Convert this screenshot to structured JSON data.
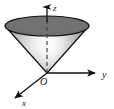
{
  "figure": {
    "background_color": "#ffffff",
    "outline_color": "#111111"
  },
  "axes": {
    "z": {
      "label": "z",
      "label_x": 53,
      "label_y": 10,
      "line": {
        "x1": 47,
        "y1": 73,
        "x2": 47,
        "y2": 5
      },
      "arrow_tip": {
        "x": 47,
        "y": 3
      },
      "visible_segment": {
        "x1": 47,
        "y1": 16,
        "x2": 47,
        "y2": 5
      },
      "hidden_segment_dashed": {
        "x1": 47,
        "y1": 73,
        "x2": 47,
        "y2": 17
      },
      "color": "#111111"
    },
    "y": {
      "label": "y",
      "label_x": 103,
      "label_y": 78,
      "line": {
        "x1": 47,
        "y1": 73,
        "x2": 97,
        "y2": 73
      },
      "arrow_tip": {
        "x": 99,
        "y": 73
      },
      "color": "#111111"
    },
    "x": {
      "label": "x",
      "label_x": 24,
      "label_y": 105,
      "line": {
        "x1": 47,
        "y1": 73,
        "x2": 14,
        "y2": 99
      },
      "arrow_tip": {
        "x": 11,
        "y": 101
      },
      "color": "#111111"
    },
    "origin": {
      "label": "O",
      "label_x": 41,
      "label_y": 84,
      "point": {
        "x": 47,
        "y": 73
      }
    }
  },
  "cone": {
    "apex": {
      "x": 47,
      "y": 73
    },
    "top_ellipse": {
      "center_x": 47,
      "center_y": 26,
      "radius_x": 42,
      "radius_y": 10,
      "fill": "#6e6e6e",
      "stroke": "#111111"
    },
    "body": {
      "left_point": {
        "x": 5,
        "y": 26
      },
      "right_point": {
        "x": 89,
        "y": 26
      },
      "gradient_light": "#efefef",
      "gradient_mid": "#b4b4b4",
      "gradient_dark": "#7d7d7d",
      "stroke": "#111111"
    },
    "dashed_axis": {
      "stroke": "#3a3a3a",
      "dash_pattern": "4 3"
    }
  }
}
